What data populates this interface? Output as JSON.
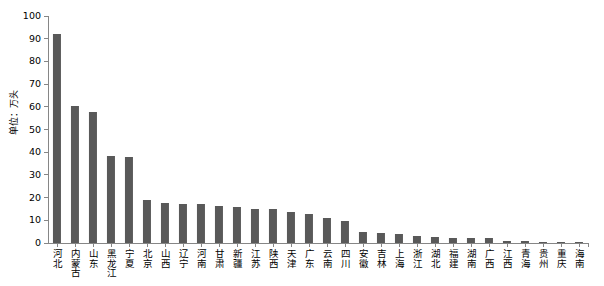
{
  "chart_data": {
    "type": "bar",
    "title": "",
    "xlabel": "",
    "ylabel": "单位：万头",
    "ylim": [
      0,
      100
    ],
    "ytick_labels": [
      "100",
      "90",
      "80",
      "70",
      "60",
      "50",
      "40",
      "30",
      "20",
      "10",
      "0"
    ],
    "ytick_values": [
      100,
      90,
      80,
      70,
      60,
      50,
      40,
      30,
      20,
      10,
      0
    ],
    "grid": false,
    "legend": "none",
    "bar_color": "#595959",
    "axis_color": "#868686",
    "categories": [
      "河北",
      "内蒙古",
      "山东",
      "黑龙江",
      "宁夏",
      "北京",
      "山西",
      "辽宁",
      "河南",
      "甘肃",
      "新疆",
      "江苏",
      "陕西",
      "天津",
      "广东",
      "云南",
      "四川",
      "安徽",
      "吉林",
      "上海",
      "浙江",
      "湖北",
      "福建",
      "湖南",
      "广西",
      "江西",
      "青海",
      "贵州",
      "重庆",
      "海南"
    ],
    "values": [
      92,
      60.5,
      57.5,
      38.5,
      38,
      19,
      17.5,
      17,
      17,
      16.5,
      16,
      15,
      15,
      13.5,
      13,
      11,
      9.5,
      5,
      4.5,
      4,
      3,
      2.6,
      2.3,
      2.2,
      2.1,
      1,
      0.8,
      0.6,
      0.5,
      0.4
    ]
  }
}
